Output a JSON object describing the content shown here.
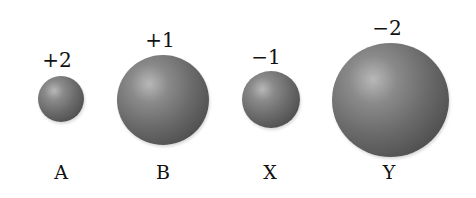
{
  "ions": [
    {
      "name": "A",
      "charge": "+2",
      "relative_size": "small"
    },
    {
      "name": "B",
      "charge": "+1",
      "relative_size": "large"
    },
    {
      "name": "X",
      "charge": "−1",
      "relative_size": "small"
    },
    {
      "name": "Y",
      "charge": "−2",
      "relative_size": "largest"
    }
  ]
}
